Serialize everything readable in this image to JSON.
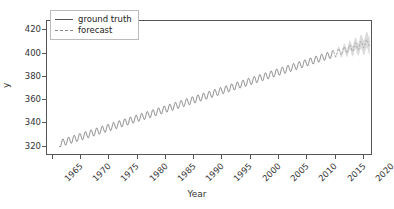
{
  "chart_data": {
    "type": "line",
    "title": "",
    "xlabel": "Year",
    "ylabel": "y",
    "xlim": [
      1964.0,
      2021.6
    ],
    "ylim": [
      312.0,
      428.0
    ],
    "grid": false,
    "legend_position": "upper left",
    "xticks": [
      1965,
      1970,
      1975,
      1980,
      1985,
      1990,
      1995,
      2000,
      2005,
      2010,
      2015,
      2020
    ],
    "xtick_labels": [
      "1965",
      "1970",
      "1975",
      "1980",
      "1985",
      "1990",
      "1995",
      "2000",
      "2005",
      "2010",
      "2015",
      "2020"
    ],
    "xtick_rotation": -45,
    "yticks": [
      320,
      340,
      360,
      380,
      400,
      420
    ],
    "ytick_labels": [
      "320",
      "340",
      "360",
      "380",
      "400",
      "420"
    ],
    "colors": {
      "ground_truth": "#555555",
      "forecast": "#888888",
      "confidence_band": "#b0b0b0",
      "axis": "#555555",
      "text": "#333333"
    },
    "series": [
      {
        "name": "ground truth",
        "style": "solid",
        "color": "#555555",
        "x_start": 1966.2,
        "x_end": 2015.0,
        "trend_start": 321.0,
        "trend_end": 399.5,
        "seasonal_amplitude": 3.1,
        "seasonal_period": 1.0,
        "seasonal_phase": 0.42,
        "quadratic_curvature": 0.0105
      },
      {
        "name": "forecast",
        "style": "dashed",
        "color": "#888888",
        "x_start": 2015.0,
        "x_end": 2021.4,
        "trend_start": 399.5,
        "trend_end": 409.5,
        "seasonal_amplitude": 3.1,
        "seasonal_period": 1.0,
        "seasonal_phase": 0.42,
        "band_sigma_start": 0.6,
        "band_sigma_end": 7.5,
        "band_color": "#b0b0b0",
        "band_opacity": 0.45
      }
    ],
    "annotations": []
  },
  "legend": {
    "items": [
      {
        "label": "ground truth",
        "style": "solid"
      },
      {
        "label": "forecast",
        "style": "dashed"
      }
    ]
  },
  "axes": {
    "x_label": "Year",
    "y_label": "y"
  }
}
